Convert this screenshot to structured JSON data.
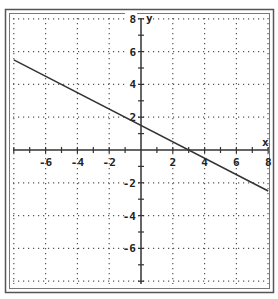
{
  "chart_data": {
    "type": "line",
    "title": "",
    "xlabel": "x",
    "ylabel": "y",
    "xlim": [
      -8,
      8
    ],
    "ylim": [
      -8,
      8
    ],
    "grid": true,
    "grid_style": "dotted",
    "grid_step": 2,
    "x_ticks": [
      -6,
      -4,
      -2,
      2,
      4,
      6,
      8
    ],
    "y_ticks": [
      8,
      6,
      4,
      2,
      -2,
      -4,
      -6
    ],
    "x_tick_labels": [
      "-6",
      "-4",
      "-2",
      "2",
      "4",
      "6",
      "8"
    ],
    "y_tick_labels": [
      "8",
      "6",
      "4",
      "2",
      "-2",
      "-4",
      "-6"
    ],
    "series": [
      {
        "name": "line",
        "equation": "y = -0.5x + 1.5",
        "slope": -0.5,
        "intercept": 1.5,
        "x": [
          -8,
          8
        ],
        "y": [
          5.5,
          -2.5
        ]
      }
    ],
    "legend": "none"
  },
  "labels": {
    "x_axis": "x",
    "y_axis": "y"
  },
  "colors": {
    "line": "#333333",
    "axis": "#333333",
    "grid": "#555555",
    "frame": "#444444"
  }
}
